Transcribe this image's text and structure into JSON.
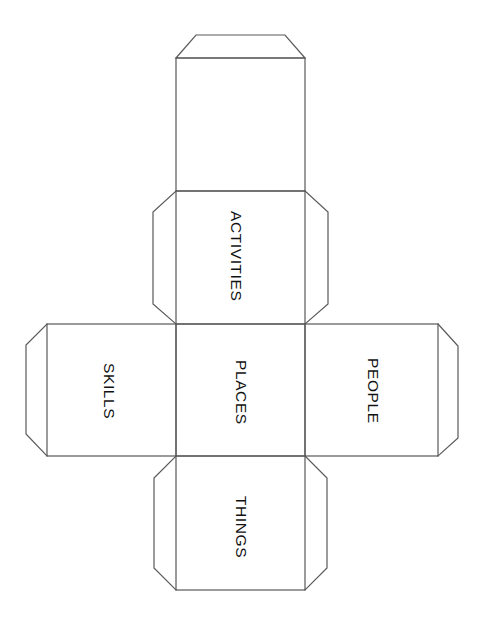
{
  "document": {
    "title": "Cube Net Template",
    "type": "foldable-cube-net",
    "background_color": "#ffffff",
    "line_color": "#595959",
    "line_width_px": 1.2,
    "text_color": "#111111",
    "text_orientation": "rotated-90-clockwise"
  },
  "faces": [
    {
      "id": "top-blank",
      "label": "",
      "position": "column-top",
      "has_glue_flap": true,
      "flap_sides": [
        "top"
      ]
    },
    {
      "id": "activities",
      "label": "ACTIVITIES",
      "position": "column-upper-middle",
      "has_glue_flap": true,
      "flap_sides": [
        "left",
        "right"
      ]
    },
    {
      "id": "skills",
      "label": "SKILLS",
      "position": "row-left",
      "has_glue_flap": true,
      "flap_sides": [
        "left"
      ]
    },
    {
      "id": "places",
      "label": "PLACES",
      "position": "center",
      "has_glue_flap": false,
      "flap_sides": []
    },
    {
      "id": "people",
      "label": "PEOPLE",
      "position": "row-right",
      "has_glue_flap": true,
      "flap_sides": [
        "right"
      ]
    },
    {
      "id": "things",
      "label": "THINGS",
      "position": "column-bottom",
      "has_glue_flap": true,
      "flap_sides": [
        "left",
        "right"
      ]
    }
  ]
}
